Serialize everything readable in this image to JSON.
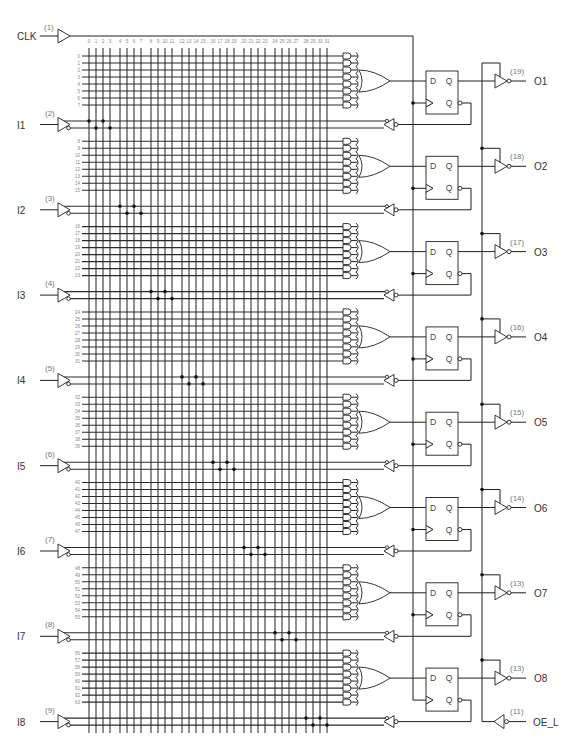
{
  "schematic": {
    "clock": {
      "name": "CLK",
      "pin": "(1)"
    },
    "inputs": [
      {
        "name": "I1",
        "pin": "(2)"
      },
      {
        "name": "I2",
        "pin": "(3)"
      },
      {
        "name": "I3",
        "pin": "(4)"
      },
      {
        "name": "I4",
        "pin": "(5)"
      },
      {
        "name": "I5",
        "pin": "(6)"
      },
      {
        "name": "I6",
        "pin": "(7)"
      },
      {
        "name": "I7",
        "pin": "(8)"
      },
      {
        "name": "I8",
        "pin": "(9)"
      }
    ],
    "outputs": [
      {
        "name": "O1",
        "pin": "(19)"
      },
      {
        "name": "O2",
        "pin": "(18)"
      },
      {
        "name": "O3",
        "pin": "(17)"
      },
      {
        "name": "O4",
        "pin": "(16)"
      },
      {
        "name": "O5",
        "pin": "(15)"
      },
      {
        "name": "O6",
        "pin": "(14)"
      },
      {
        "name": "O7",
        "pin": "(13)"
      },
      {
        "name": "O8",
        "pin": "(13)"
      }
    ],
    "output_enable": {
      "name": "OE_L",
      "pin": "(11)"
    },
    "flip_flop": {
      "d": "D",
      "q": "Q",
      "qn": "Q"
    },
    "column_labels": [
      "0",
      "1",
      "2",
      "3",
      "4",
      "5",
      "6",
      "7",
      "8",
      "9",
      "10",
      "11",
      "12",
      "13",
      "14",
      "15",
      "16",
      "17",
      "18",
      "19",
      "20",
      "21",
      "22",
      "23",
      "24",
      "25",
      "26",
      "27",
      "28",
      "29",
      "30",
      "31"
    ],
    "row_labels": [
      "0",
      "1",
      "2",
      "3",
      "4",
      "5",
      "6",
      "7",
      "8",
      "9",
      "10",
      "11",
      "12",
      "13",
      "14",
      "15",
      "16",
      "17",
      "18",
      "19",
      "20",
      "21",
      "22",
      "23",
      "24",
      "25",
      "26",
      "27",
      "28",
      "29",
      "30",
      "31",
      "32",
      "33",
      "34",
      "35",
      "36",
      "37",
      "38",
      "39",
      "40",
      "41",
      "42",
      "43",
      "44",
      "45",
      "46",
      "47",
      "48",
      "49",
      "50",
      "51",
      "52",
      "53",
      "54",
      "55",
      "56",
      "57",
      "58",
      "59",
      "60",
      "61",
      "62",
      "63"
    ],
    "colors": {
      "line": "#1f1f1f",
      "label": "#333333",
      "pin_label": "#777777",
      "index_label": "#8a8a8a",
      "background": "#ffffff"
    }
  }
}
